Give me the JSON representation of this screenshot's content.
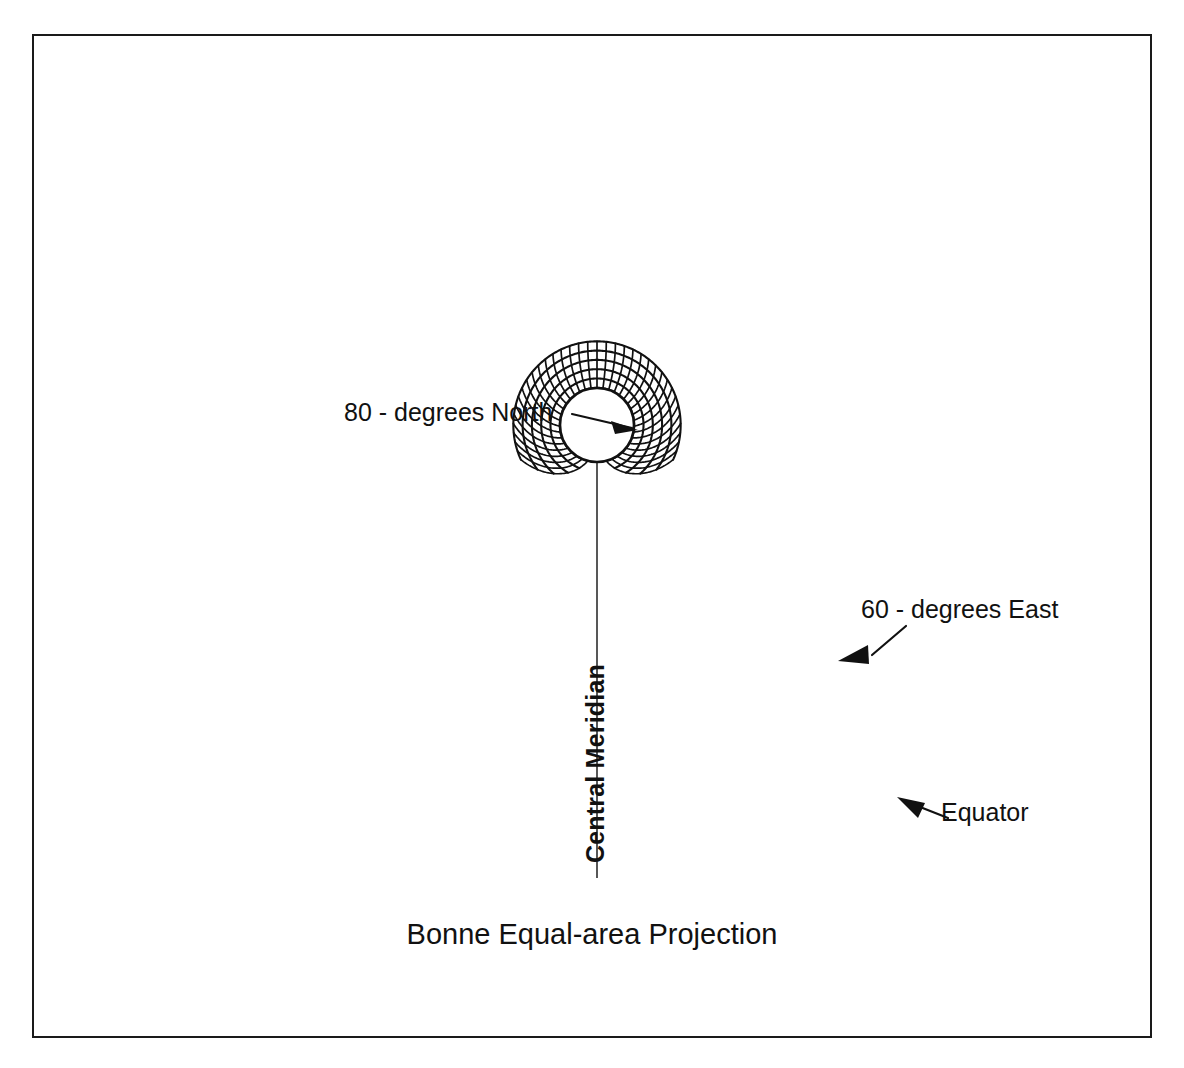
{
  "figure": {
    "title": "Bonne Equal-area Projection",
    "frame": {
      "stroke_color": "#1a1a1a",
      "background": "#ffffff"
    },
    "labels": {
      "standard_parallel": "80 - degrees North",
      "meridian_east": "60 - degrees East",
      "equator": "Equator",
      "central_meridian": "Central Meridian"
    },
    "annotations": [
      {
        "name": "standard-parallel-callout",
        "text": "80 - degrees North",
        "arrow": "right"
      },
      {
        "name": "meridian-east-callout",
        "text": "60 - degrees East",
        "arrow": "down-left"
      },
      {
        "name": "equator-callout",
        "text": "Equator",
        "arrow": "up-left"
      },
      {
        "name": "central-meridian-label",
        "text": "Central Meridian",
        "arrow": "none"
      }
    ]
  },
  "chart_data": {
    "type": "line",
    "title": "Bonne Equal-area Projection",
    "subtitle": "",
    "xlabel": "",
    "ylabel": "",
    "projection": "Bonne Equal-area",
    "standard_parallel_deg": 80,
    "central_meridian_deg": 0,
    "graticule_interval_deg": 10,
    "longitude_extent_deg": [
      -180,
      180
    ],
    "latitude_extent_deg": [
      0,
      90
    ],
    "parallels": [
      0,
      10,
      20,
      30,
      40,
      50,
      60,
      70,
      80,
      90
    ],
    "meridians": [
      -180,
      -170,
      -160,
      -150,
      -140,
      -130,
      -120,
      -110,
      -100,
      -90,
      -80,
      -70,
      -60,
      -50,
      -40,
      -30,
      -20,
      -10,
      0,
      10,
      20,
      30,
      40,
      50,
      60,
      70,
      80,
      90,
      100,
      110,
      120,
      130,
      140,
      150,
      160,
      170,
      180
    ],
    "labeled_features": [
      {
        "feature": "standard parallel",
        "value": "80 - degrees North"
      },
      {
        "feature": "meridian",
        "value": "60 - degrees East"
      },
      {
        "feature": "parallel",
        "value": "Equator"
      },
      {
        "feature": "meridian",
        "value": "Central Meridian"
      }
    ],
    "grid": true,
    "legend": "none",
    "stroke_color": "#111111"
  }
}
